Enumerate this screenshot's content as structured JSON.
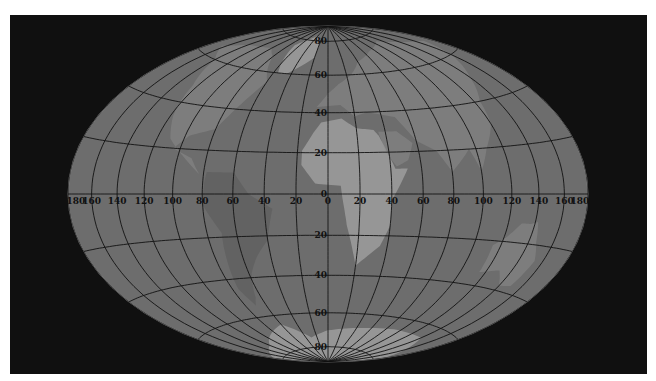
{
  "map": {
    "projection": "hammer",
    "center": [
      328,
      194
    ],
    "semi_axes": [
      260,
      168
    ],
    "colors": {
      "background": "#101010",
      "globe": "#6d6d6d",
      "land": "#8a8a8a",
      "land_light": "#b8b8b8",
      "land_dark": "#5a5a5a",
      "graticule": "#121212",
      "label": "#111111"
    },
    "meridians_deg": [
      -180,
      -160,
      -140,
      -120,
      -100,
      -80,
      -60,
      -40,
      -20,
      0,
      20,
      40,
      60,
      80,
      100,
      120,
      140,
      160,
      180
    ],
    "parallels_deg": [
      -80,
      -60,
      -40,
      -20,
      0,
      20,
      40,
      60,
      80
    ],
    "longitude_labels": [
      {
        "text": "180",
        "lon": -180
      },
      {
        "text": "160",
        "lon": -160
      },
      {
        "text": "140",
        "lon": -140
      },
      {
        "text": "120",
        "lon": -120
      },
      {
        "text": "100",
        "lon": -100
      },
      {
        "text": "80",
        "lon": -80
      },
      {
        "text": "60",
        "lon": -60
      },
      {
        "text": "40",
        "lon": -40
      },
      {
        "text": "20",
        "lon": -20
      },
      {
        "text": "0",
        "lon": 0
      },
      {
        "text": "20",
        "lon": 20
      },
      {
        "text": "40",
        "lon": 40
      },
      {
        "text": "60",
        "lon": 60
      },
      {
        "text": "80",
        "lon": 80
      },
      {
        "text": "100",
        "lon": 100
      },
      {
        "text": "120",
        "lon": 120
      },
      {
        "text": "140",
        "lon": 140
      },
      {
        "text": "160",
        "lon": 160
      },
      {
        "text": "180",
        "lon": 180
      }
    ],
    "latitude_labels": [
      {
        "text": "80",
        "lat": 80
      },
      {
        "text": "60",
        "lat": 60
      },
      {
        "text": "40",
        "lat": 40
      },
      {
        "text": "20",
        "lat": 20
      },
      {
        "text": "0",
        "lat": 0
      },
      {
        "text": "20",
        "lat": -20
      },
      {
        "text": "40",
        "lat": -40
      },
      {
        "text": "60",
        "lat": -60
      },
      {
        "text": "80",
        "lat": -80
      }
    ],
    "landmasses": [
      {
        "name": "africa",
        "shade": "land_light",
        "pts": [
          [
            -17,
            21
          ],
          [
            -10,
            30
          ],
          [
            -5,
            35
          ],
          [
            10,
            37
          ],
          [
            20,
            32
          ],
          [
            32,
            31
          ],
          [
            35,
            28
          ],
          [
            43,
            12
          ],
          [
            51,
            12
          ],
          [
            40,
            -3
          ],
          [
            40,
            -15
          ],
          [
            35,
            -25
          ],
          [
            20,
            -35
          ],
          [
            17,
            -28
          ],
          [
            12,
            -15
          ],
          [
            9,
            -2
          ],
          [
            8,
            4
          ],
          [
            -8,
            5
          ],
          [
            -17,
            14
          ]
        ]
      },
      {
        "name": "arabia",
        "shade": "land",
        "pts": [
          [
            35,
            30
          ],
          [
            48,
            30
          ],
          [
            57,
            24
          ],
          [
            52,
            16
          ],
          [
            44,
            13
          ],
          [
            38,
            20
          ]
        ]
      },
      {
        "name": "eurasia",
        "shade": "land",
        "pts": [
          [
            -9,
            43
          ],
          [
            0,
            50
          ],
          [
            10,
            55
          ],
          [
            25,
            60
          ],
          [
            40,
            67
          ],
          [
            70,
            72
          ],
          [
            110,
            76
          ],
          [
            140,
            72
          ],
          [
            170,
            68
          ],
          [
            160,
            60
          ],
          [
            140,
            50
          ],
          [
            125,
            40
          ],
          [
            120,
            30
          ],
          [
            108,
            20
          ],
          [
            100,
            10
          ],
          [
            95,
            20
          ],
          [
            80,
            10
          ],
          [
            72,
            20
          ],
          [
            60,
            25
          ],
          [
            50,
            37
          ],
          [
            30,
            40
          ],
          [
            20,
            38
          ],
          [
            10,
            44
          ]
        ]
      },
      {
        "name": "north-america",
        "shade": "land",
        "pts": [
          [
            -165,
            65
          ],
          [
            -140,
            70
          ],
          [
            -100,
            72
          ],
          [
            -80,
            68
          ],
          [
            -60,
            55
          ],
          [
            -70,
            43
          ],
          [
            -80,
            30
          ],
          [
            -97,
            26
          ],
          [
            -105,
            20
          ],
          [
            -90,
            16
          ],
          [
            -83,
            9
          ],
          [
            -95,
            16
          ],
          [
            -110,
            24
          ],
          [
            -118,
            34
          ],
          [
            -125,
            48
          ],
          [
            -140,
            60
          ]
        ]
      },
      {
        "name": "south-america",
        "shade": "land_dark",
        "pts": [
          [
            -78,
            10
          ],
          [
            -60,
            10
          ],
          [
            -50,
            0
          ],
          [
            -35,
            -7
          ],
          [
            -40,
            -22
          ],
          [
            -50,
            -30
          ],
          [
            -58,
            -38
          ],
          [
            -65,
            -50
          ],
          [
            -70,
            -54
          ],
          [
            -75,
            -45
          ],
          [
            -72,
            -30
          ],
          [
            -70,
            -18
          ],
          [
            -80,
            -5
          ],
          [
            -79,
            5
          ]
        ]
      },
      {
        "name": "greenland",
        "shade": "land_light",
        "pts": [
          [
            -55,
            60
          ],
          [
            -45,
            60
          ],
          [
            -20,
            70
          ],
          [
            -20,
            80
          ],
          [
            -40,
            83
          ],
          [
            -60,
            80
          ],
          [
            -70,
            76
          ]
        ]
      },
      {
        "name": "australia",
        "shade": "land",
        "pts": [
          [
            114,
            -22
          ],
          [
            122,
            -18
          ],
          [
            130,
            -12
          ],
          [
            137,
            -12
          ],
          [
            142,
            -11
          ],
          [
            146,
            -19
          ],
          [
            153,
            -26
          ],
          [
            150,
            -37
          ],
          [
            140,
            -38
          ],
          [
            130,
            -32
          ],
          [
            115,
            -34
          ]
        ]
      },
      {
        "name": "antarctica",
        "shade": "land_light",
        "pts": [
          [
            -180,
            -78
          ],
          [
            -120,
            -74
          ],
          [
            -60,
            -65
          ],
          [
            -30,
            -74
          ],
          [
            0,
            -70
          ],
          [
            40,
            -68
          ],
          [
            90,
            -66
          ],
          [
            140,
            -66
          ],
          [
            180,
            -78
          ],
          [
            180,
            -90
          ],
          [
            -180,
            -90
          ]
        ]
      }
    ]
  }
}
